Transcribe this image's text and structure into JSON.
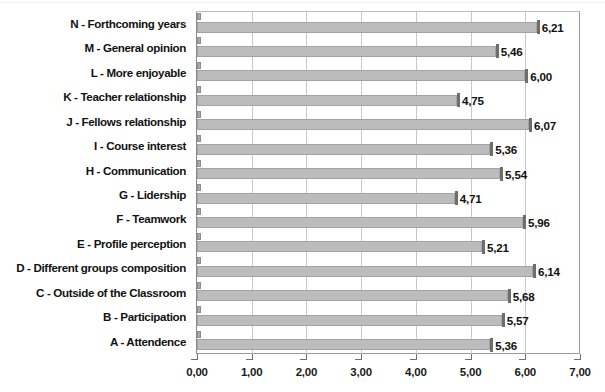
{
  "chart_data": {
    "type": "bar",
    "orientation": "horizontal",
    "title": "",
    "subtitle": "",
    "xlabel": "",
    "ylabel": "",
    "xlim": [
      0,
      7
    ],
    "grid": true,
    "legend": "none",
    "decimal_separator": ",",
    "xticks": [
      "0,00",
      "1,00",
      "2,00",
      "3,00",
      "4,00",
      "5,00",
      "6,00",
      "7,00"
    ],
    "xtick_values": [
      0,
      1,
      2,
      3,
      4,
      5,
      6,
      7
    ],
    "categories": [
      "N - Forthcoming years",
      "M - General opinion",
      "L - More enjoyable",
      "K - Teacher relationship",
      "J - Fellows relationship",
      "I - Course interest",
      "H - Communication",
      "G - Lidership",
      "F - Teamwork",
      "E - Profile perception",
      "D - Different groups composition",
      "C - Outside of the Classroom",
      "B - Participation",
      "A - Attendence"
    ],
    "series": [
      {
        "name": "secondary",
        "values": [
          0.08,
          0.08,
          0.08,
          0.08,
          0.08,
          0.08,
          0.08,
          0.08,
          0.08,
          0.08,
          0.08,
          0.08,
          0.08,
          0.08
        ],
        "color": "#a9a9a9",
        "labels_shown": false
      },
      {
        "name": "mean",
        "values": [
          6.21,
          5.46,
          6.0,
          4.75,
          6.07,
          5.36,
          5.54,
          4.71,
          5.96,
          5.21,
          6.14,
          5.68,
          5.57,
          5.36
        ],
        "color": "#bcbcbc",
        "labels_shown": true,
        "data_labels": [
          "6,21",
          "5,46",
          "6,00",
          "4,75",
          "6,07",
          "5,36",
          "5,54",
          "4,71",
          "5,96",
          "5,21",
          "6,14",
          "5,68",
          "5,57",
          "5,36"
        ]
      }
    ]
  },
  "colors": {
    "bar_main": "#bcbcbc",
    "bar_stub": "#a9a9a9",
    "axis": "#8a8a8a",
    "gridline": "#c9c9c9",
    "text": "#111111",
    "background": "#ffffff"
  }
}
